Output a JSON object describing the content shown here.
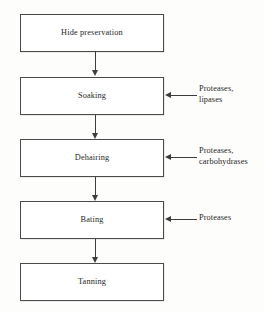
{
  "diagram": {
    "type": "process-flowchart",
    "orientation": "vertical-top-to-bottom",
    "steps": [
      {
        "id": "hide-preservation",
        "label": "Hide preservation"
      },
      {
        "id": "soaking",
        "label": "Soaking"
      },
      {
        "id": "dehairing",
        "label": "Dehairing"
      },
      {
        "id": "bating",
        "label": "Bating"
      },
      {
        "id": "tanning",
        "label": "Tanning"
      }
    ],
    "enzyme_inputs": [
      {
        "target_step": "soaking",
        "lines": [
          "Proteases,",
          "lipases"
        ],
        "arrow_direction": "left"
      },
      {
        "target_step": "dehairing",
        "lines": [
          "Proteases,",
          "carbohydrases"
        ],
        "arrow_direction": "left"
      },
      {
        "target_step": "bating",
        "lines": [
          "Proteases"
        ],
        "arrow_direction": "left"
      }
    ],
    "flow_arrows": [
      {
        "from": "hide-preservation",
        "to": "soaking",
        "direction": "down"
      },
      {
        "from": "soaking",
        "to": "dehairing",
        "direction": "down"
      },
      {
        "from": "dehairing",
        "to": "bating",
        "direction": "down"
      },
      {
        "from": "bating",
        "to": "tanning",
        "direction": "down"
      }
    ],
    "colors": {
      "background": "#fdfdfc",
      "box_fill": "#ffffff",
      "box_border": "#4a4a4a",
      "arrow": "#3d3d3d",
      "text": "#1f1f1f"
    }
  }
}
